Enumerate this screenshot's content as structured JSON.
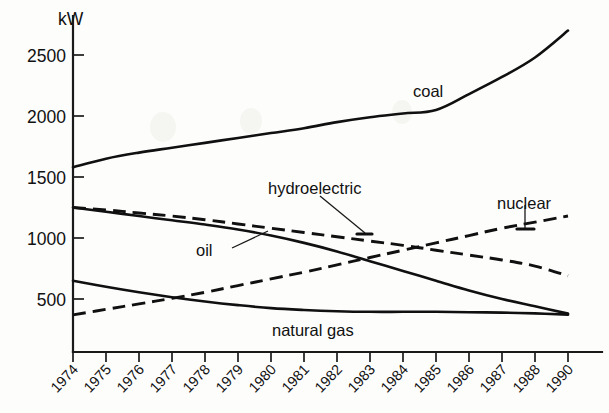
{
  "chart_data": {
    "type": "line",
    "title": "",
    "xlabel": "",
    "ylabel": "kW",
    "yunit_label": "kW",
    "grid": false,
    "legend_position": "inline-labels",
    "xlim": [
      1974,
      1990
    ],
    "ylim": [
      0,
      2750
    ],
    "yticks": [
      500,
      1000,
      1500,
      2000,
      2500
    ],
    "ytick_labels": [
      "500",
      "1000",
      "1500",
      "2000",
      "2500"
    ],
    "categories": [
      "1974",
      "1975",
      "1976",
      "1977",
      "1978",
      "1979",
      "1980",
      "1981",
      "1982",
      "1983",
      "1984",
      "1985",
      "1986",
      "1987",
      "1988",
      "1990"
    ],
    "series": [
      {
        "name": "coal",
        "style": "solid",
        "label": "coal",
        "values": [
          1580,
          1650,
          1700,
          1740,
          1780,
          1820,
          1860,
          1900,
          1950,
          1990,
          2020,
          2050,
          2180,
          2320,
          2480,
          2700
        ]
      },
      {
        "name": "oil",
        "style": "solid",
        "label": "oil",
        "values": [
          1250,
          1215,
          1180,
          1145,
          1110,
          1070,
          1020,
          960,
          890,
          810,
          730,
          650,
          570,
          500,
          440,
          380
        ]
      },
      {
        "name": "hydroelectric",
        "style": "dashed",
        "label": "hydroelectric",
        "values": [
          1250,
          1230,
          1205,
          1180,
          1150,
          1115,
          1080,
          1045,
          1010,
          975,
          940,
          900,
          860,
          820,
          770,
          690
        ]
      },
      {
        "name": "nuclear",
        "style": "dashed",
        "label": "nuclear",
        "values": [
          370,
          415,
          460,
          505,
          555,
          610,
          665,
          720,
          780,
          840,
          900,
          960,
          1020,
          1080,
          1130,
          1180
        ]
      },
      {
        "name": "natural gas",
        "style": "solid",
        "label": "natural gas",
        "values": [
          650,
          600,
          555,
          515,
          480,
          450,
          425,
          410,
          400,
          395,
          395,
          395,
          392,
          388,
          382,
          372
        ]
      }
    ],
    "annotations": [
      {
        "text": "coal",
        "target_series": "coal",
        "target_year": "1986"
      },
      {
        "text": "hydroelectric",
        "target_series": "hydroelectric",
        "target_year": "1983"
      },
      {
        "text": "nuclear",
        "target_series": "nuclear",
        "target_year": "1987"
      },
      {
        "text": "oil",
        "target_series": "oil",
        "target_year": "1977"
      },
      {
        "text": "natural gas",
        "target_series": "natural gas",
        "target_year": "1983"
      }
    ]
  }
}
